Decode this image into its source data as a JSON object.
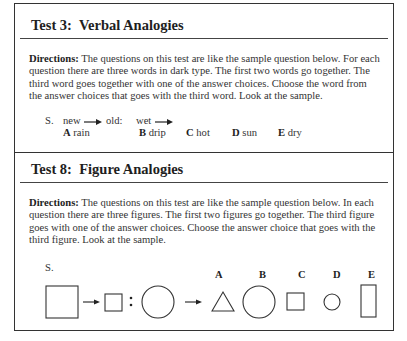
{
  "test3": {
    "title": "Test 3:  Verbal Analogies",
    "directions_label": "Directions:",
    "directions_text": " The questions on this test are like the sample question below. For each question there are three words in dark type. The first two words go together. The third word goes together with one of the answer choices. Choose the word from the answer choices that goes with the third word. Look at the sample.",
    "sample": {
      "marker": "S.",
      "word1": "new",
      "word2": "old:",
      "word3": "wet",
      "choices": [
        {
          "letter": "A",
          "word": "rain"
        },
        {
          "letter": "B",
          "word": "drip"
        },
        {
          "letter": "C",
          "word": "hot"
        },
        {
          "letter": "D",
          "word": "sun"
        },
        {
          "letter": "E",
          "word": "dry"
        }
      ]
    }
  },
  "test8": {
    "title": "Test 8:  Figure Analogies",
    "directions_label": "Directions:",
    "directions_text": " The questions on this test are like the sample question below. In each question there are three figures. The first two figures go together. The third figure goes with one of the answer choices. Choose the answer choice that goes with the third figure. Look at the sample.",
    "sample": {
      "marker": "S.",
      "stem_figures": [
        "large-square",
        "small-square",
        "large-circle"
      ],
      "separator": ":",
      "choices": [
        {
          "letter": "A",
          "figure": "triangle"
        },
        {
          "letter": "B",
          "figure": "large-circle"
        },
        {
          "letter": "C",
          "figure": "small-square"
        },
        {
          "letter": "D",
          "figure": "small-circle"
        },
        {
          "letter": "E",
          "figure": "tall-rectangle"
        }
      ]
    }
  }
}
